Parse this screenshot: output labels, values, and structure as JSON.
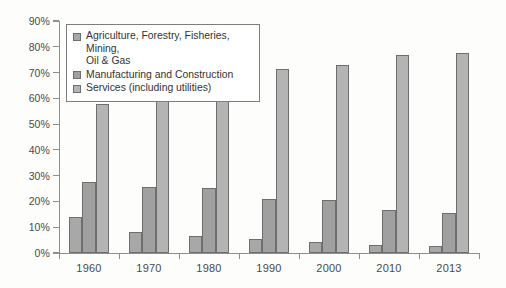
{
  "chart_data": {
    "type": "bar",
    "title": "",
    "subtitle": "",
    "xlabel": "",
    "ylabel": "",
    "categories": [
      "1960",
      "1970",
      "1980",
      "1990",
      "2000",
      "2010",
      "2013"
    ],
    "series": [
      {
        "name": "Agriculture, Forestry, Fisheries, Mining, Oil & Gas",
        "color": "#a8a8a8",
        "values": [
          13.8,
          8.0,
          6.6,
          5.4,
          4.2,
          3.0,
          2.8
        ]
      },
      {
        "name": "Manufacturing and Construction",
        "color": "#a0a0a0",
        "values": [
          27.7,
          25.6,
          25.2,
          20.8,
          20.4,
          16.5,
          15.6
        ]
      },
      {
        "name": "Services (including utilities)",
        "color": "#b4b4b4",
        "values": [
          57.7,
          66.0,
          67.0,
          71.2,
          73.0,
          77.0,
          77.7
        ]
      }
    ],
    "ylim": [
      0,
      90
    ],
    "ytick_values": [
      0,
      10,
      20,
      30,
      40,
      50,
      60,
      70,
      80,
      90
    ],
    "ytick_labels": [
      "0%",
      "10%",
      "20%",
      "30%",
      "40%",
      "50%",
      "60%",
      "70%",
      "80%",
      "90%"
    ],
    "grid": false,
    "legend_position": "upper-left-inside",
    "legend_entries": [
      "Agriculture, Forestry, Fisheries, Mining,\nOil & Gas",
      "Manufacturing and Construction",
      "Services (including utilities)"
    ]
  }
}
